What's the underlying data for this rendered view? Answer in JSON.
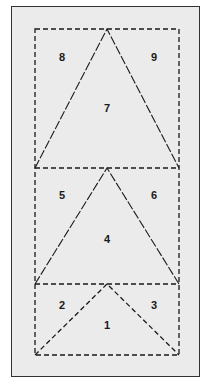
{
  "diagram": {
    "background": "#ebebeb",
    "frame_border": "#333333",
    "line_color": "#1a1a1a",
    "sections": [
      {
        "name": "top",
        "triangle": "7",
        "left_corner": "8",
        "right_corner": "9"
      },
      {
        "name": "middle",
        "triangle": "4",
        "left_corner": "5",
        "right_corner": "6"
      },
      {
        "name": "bottom",
        "triangle": "1",
        "left_corner": "2",
        "right_corner": "3"
      }
    ],
    "labels": {
      "l1": "1",
      "l2": "2",
      "l3": "3",
      "l4": "4",
      "l5": "5",
      "l6": "6",
      "l7": "7",
      "l8": "8",
      "l9": "9"
    }
  }
}
